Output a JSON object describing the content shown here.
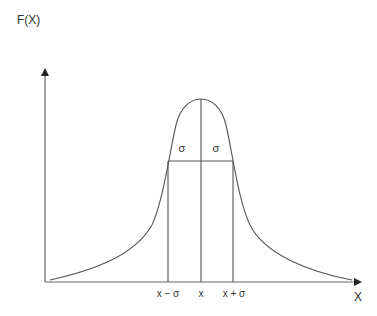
{
  "diagram": {
    "type": "distribution-curve",
    "y_axis_label": "F(X)",
    "x_axis_label": "X",
    "tick_labels": {
      "left": "x − σ",
      "center": "x",
      "right": "x + σ"
    },
    "sigma_labels": {
      "left": "σ",
      "right": "σ"
    },
    "colors": {
      "stroke": "#555555",
      "text": "#333333",
      "background": "#ffffff"
    }
  }
}
